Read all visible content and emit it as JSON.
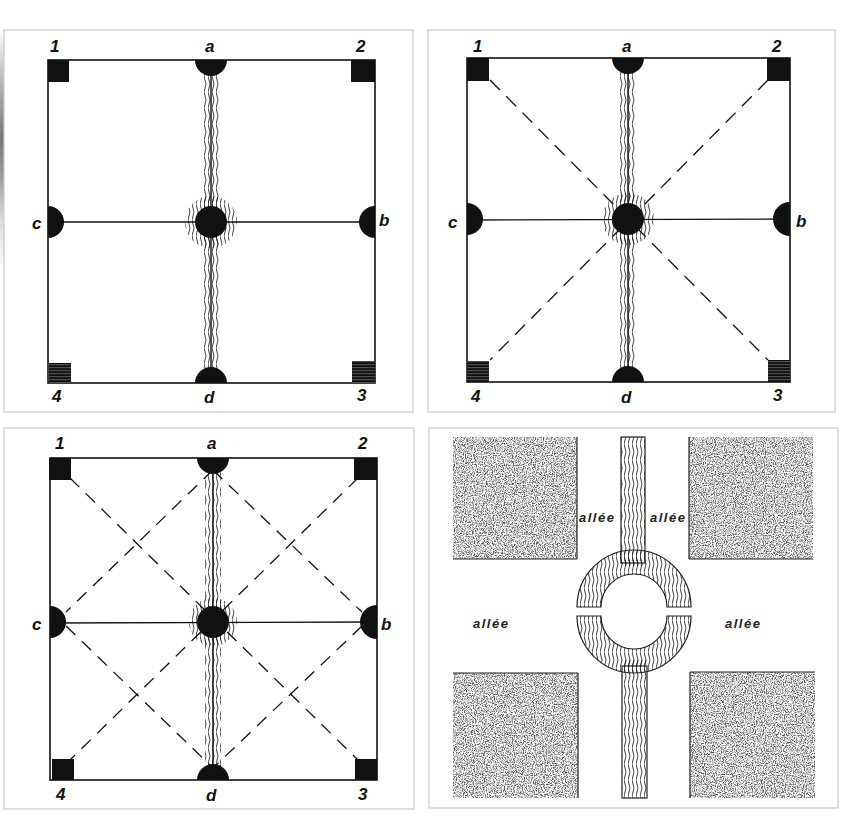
{
  "figure": {
    "panels": [
      {
        "id": "panel-1",
        "corner_labels": [
          "1",
          "2",
          "3",
          "4"
        ],
        "side_labels": {
          "top": "a",
          "right": "b",
          "left": "c",
          "bottom": "d"
        },
        "diagonals": "none"
      },
      {
        "id": "panel-2",
        "corner_labels": [
          "1",
          "2",
          "3",
          "4"
        ],
        "side_labels": {
          "top": "a",
          "right": "b",
          "left": "c",
          "bottom": "d"
        },
        "diagonals": "corner-to-corner"
      },
      {
        "id": "panel-3",
        "corner_labels": [
          "1",
          "2",
          "3",
          "4"
        ],
        "side_labels": {
          "top": "a",
          "right": "b",
          "left": "c",
          "bottom": "d"
        },
        "diagonals": "corner-to-corner and midpoint diamond"
      },
      {
        "id": "panel-4",
        "path_labels": [
          "allée",
          "allée",
          "allée",
          "allée"
        ],
        "features": [
          "four textured garden beds",
          "central water channel",
          "circular basin with horizontal gap"
        ]
      }
    ],
    "colors": {
      "ink": "#111111",
      "paper": "#ffffff",
      "frame": "#c8c8c8"
    }
  }
}
